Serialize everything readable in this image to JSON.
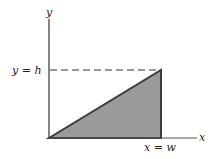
{
  "diagram": {
    "axes": {
      "x_label": "x",
      "y_label": "y"
    },
    "annotations": {
      "height_line": "y = h",
      "width_line": "x = w"
    },
    "shape": {
      "type": "right triangle",
      "vertices": [
        "origin",
        "(w, h)",
        "(w, 0)"
      ],
      "fill_color": "#9a9a9a",
      "edge_color": "#3a3a3a"
    }
  }
}
